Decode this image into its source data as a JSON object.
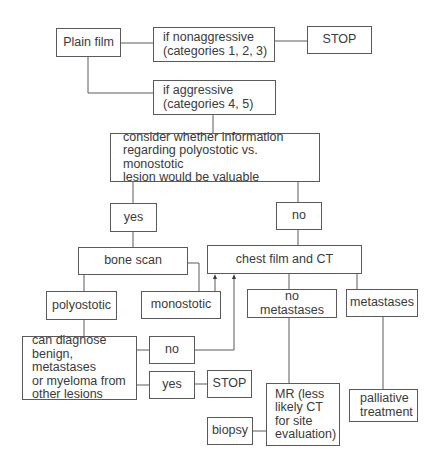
{
  "diagram": {
    "type": "flowchart",
    "nodes": {
      "plain_film": "Plain film",
      "nonaggressive": "if nonaggressive\n(categories 1, 2, 3)",
      "stop_top": "STOP",
      "aggressive": "if aggressive\n(categories 4, 5)",
      "consider": "consider whether information\nregarding polyostotic vs. monostotic\nlesion would be valuable",
      "yes_top": "yes",
      "no_top": "no",
      "bone_scan": "bone scan",
      "chest_film_ct": "chest film and CT",
      "polyostotic": "polyostotic",
      "monostotic": "monostotic",
      "no_metastases": "no metastases",
      "metastases": "metastases",
      "can_diagnose": "can diagnose\nbenign, metastases\nor myeloma from\nother lesions",
      "no_bottom": "no",
      "yes_bottom": "yes",
      "stop_bottom": "STOP",
      "mr": "MR (less\nlikely CT\nfor site\nevaluation)",
      "palliative": "palliative\ntreatment",
      "biopsy": "biopsy"
    },
    "edges": [
      {
        "from": "plain_film",
        "to": "nonaggressive"
      },
      {
        "from": "nonaggressive",
        "to": "stop_top"
      },
      {
        "from": "plain_film",
        "to": "aggressive"
      },
      {
        "from": "aggressive",
        "to": "consider"
      },
      {
        "from": "consider",
        "to": "yes_top"
      },
      {
        "from": "consider",
        "to": "no_top"
      },
      {
        "from": "yes_top",
        "to": "bone_scan"
      },
      {
        "from": "no_top",
        "to": "chest_film_ct"
      },
      {
        "from": "bone_scan",
        "to": "polyostotic"
      },
      {
        "from": "bone_scan",
        "to": "monostotic"
      },
      {
        "from": "monostotic",
        "to": "chest_film_ct",
        "arrow": true
      },
      {
        "from": "polyostotic",
        "to": "can_diagnose"
      },
      {
        "from": "can_diagnose",
        "to": "no_bottom"
      },
      {
        "from": "can_diagnose",
        "to": "yes_bottom"
      },
      {
        "from": "no_bottom",
        "to": "chest_film_ct",
        "arrow": true
      },
      {
        "from": "yes_bottom",
        "to": "stop_bottom"
      },
      {
        "from": "chest_film_ct",
        "to": "no_metastases"
      },
      {
        "from": "chest_film_ct",
        "to": "metastases"
      },
      {
        "from": "no_metastases",
        "to": "mr"
      },
      {
        "from": "metastases",
        "to": "palliative"
      },
      {
        "from": "mr",
        "to": "biopsy"
      }
    ]
  }
}
